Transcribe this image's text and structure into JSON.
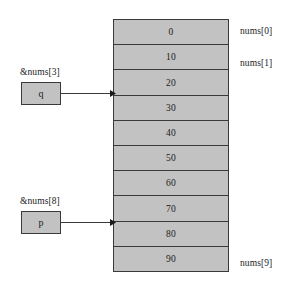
{
  "diagram": {
    "colors": {
      "cell_fill": "#c2c2c2",
      "stroke": "#3a3a3a",
      "text": "#1a1a1a",
      "background": "#ffffff"
    },
    "array": {
      "name": "nums",
      "cells": [
        {
          "value": "0",
          "index": 0
        },
        {
          "value": "10",
          "index": 1
        },
        {
          "value": "20",
          "index": 2
        },
        {
          "value": "30",
          "index": 3
        },
        {
          "value": "40",
          "index": 4
        },
        {
          "value": "50",
          "index": 5
        },
        {
          "value": "60",
          "index": 6
        },
        {
          "value": "70",
          "index": 7
        },
        {
          "value": "80",
          "index": 8
        },
        {
          "value": "90",
          "index": 9
        }
      ]
    },
    "index_labels": [
      {
        "text": "nums[0]",
        "cell": 0
      },
      {
        "text": "nums[1]",
        "cell": 1
      },
      {
        "text": "nums[9]",
        "cell": 9
      }
    ],
    "pointers": [
      {
        "variable": "q",
        "caption": "&nums[3]",
        "points_to_index": 3,
        "arrow": "arrow-right"
      },
      {
        "variable": "p",
        "caption": "&nums[8]",
        "points_to_index": 8,
        "arrow": "arrow-right"
      }
    ]
  }
}
